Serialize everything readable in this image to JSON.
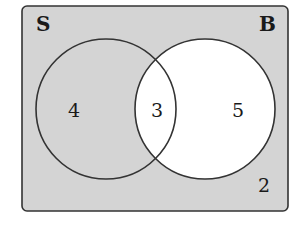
{
  "diagram": {
    "type": "venn",
    "universe": {
      "label": "",
      "count_outside": "2"
    },
    "sets": [
      {
        "name": "S",
        "label": "S",
        "only_count": "4"
      },
      {
        "name": "B",
        "label": "B",
        "only_count": "5"
      }
    ],
    "intersection": {
      "count": "3"
    },
    "colors": {
      "shaded": "#d4d4d4",
      "unshaded": "#ffffff",
      "outline": "#333333"
    },
    "shading_note": "Region B is unshaded; everything else is shaded"
  }
}
